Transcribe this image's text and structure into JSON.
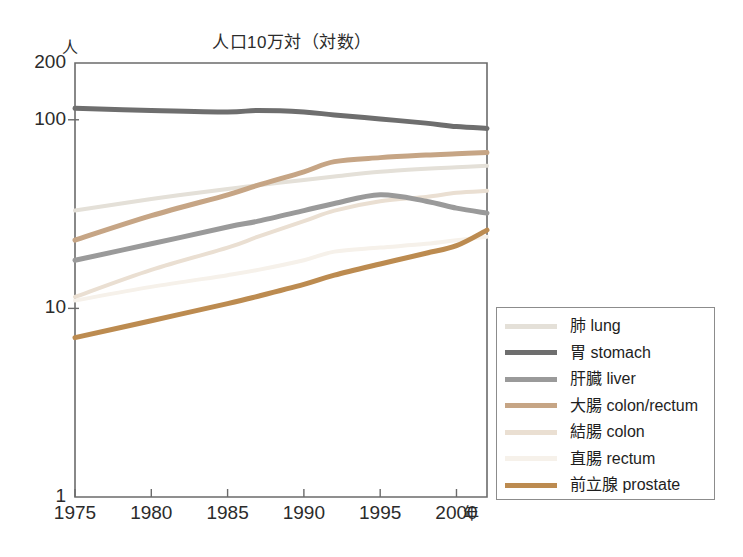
{
  "chart_data": {
    "type": "line",
    "title": "人口10万対（対数）",
    "ylabel": "人",
    "xlabel": "年",
    "log_y": true,
    "grid": false,
    "legend_position": "right-bottom",
    "xlim": [
      1975,
      2002
    ],
    "ylim": [
      1,
      200
    ],
    "ytick_labels": [
      "200",
      "100",
      "10",
      "1"
    ],
    "ytick_values": [
      200,
      100,
      10,
      1
    ],
    "xtick_labels": [
      "1975",
      "1980",
      "1985",
      "1990",
      "1995",
      "2000"
    ],
    "xtick_values": [
      1975,
      1980,
      1985,
      1990,
      1995,
      2000
    ],
    "x": [
      1975,
      1980,
      1985,
      1987,
      1990,
      1992,
      1995,
      1998,
      2000,
      2002
    ],
    "series": [
      {
        "name": "肺 lung",
        "name_ja": "肺",
        "name_en": "lung",
        "color": "#e4e0d8",
        "width": 4,
        "values": [
          33,
          38,
          43,
          45,
          48,
          50,
          53,
          55,
          56,
          57
        ]
      },
      {
        "name": "胃 stomach",
        "name_ja": "胃",
        "name_en": "stomach",
        "color": "#6e6e6e",
        "width": 5,
        "values": [
          115,
          112,
          110,
          112,
          110,
          106,
          101,
          96,
          92,
          90
        ]
      },
      {
        "name": "肝臓 liver",
        "name_ja": "肝臓",
        "name_en": "liver",
        "color": "#9a9a9a",
        "width": 5,
        "values": [
          18,
          22,
          27,
          29,
          33,
          36,
          40,
          37,
          34,
          32
        ]
      },
      {
        "name": "大腸 colon/rectum",
        "name_ja": "大腸",
        "name_en": "colon/rectum",
        "color": "#c6a585",
        "width": 5,
        "values": [
          23,
          31,
          40,
          45,
          53,
          60,
          63,
          65,
          66,
          67
        ]
      },
      {
        "name": "結腸 colon",
        "name_ja": "結腸",
        "name_en": "colon",
        "color": "#eadfd2",
        "width": 4,
        "values": [
          11.5,
          16,
          21,
          24,
          29,
          33,
          37,
          39,
          41,
          42
        ]
      },
      {
        "name": "直腸 rectum",
        "name_ja": "直腸",
        "name_en": "rectum",
        "color": "#f6f1ea",
        "width": 4,
        "values": [
          11,
          13,
          15,
          16,
          18,
          20,
          21,
          22,
          23,
          24
        ]
      },
      {
        "name": "前立腺 prostate",
        "name_ja": "前立腺",
        "name_en": "prostate",
        "color": "#bc8b50",
        "width": 5,
        "values": [
          7,
          8.6,
          10.6,
          11.6,
          13.4,
          15,
          17.2,
          19.6,
          21.5,
          26
        ]
      }
    ]
  },
  "legend": {
    "items": [
      {
        "label": "肺 lung",
        "color": "#e4e0d8"
      },
      {
        "label": "胃 stomach",
        "color": "#6e6e6e"
      },
      {
        "label": "肝臓 liver",
        "color": "#9a9a9a"
      },
      {
        "label": "大腸 colon/rectum",
        "color": "#c6a585"
      },
      {
        "label": "結腸 colon",
        "color": "#eadfd2"
      },
      {
        "label": "直腸 rectum",
        "color": "#f6f1ea"
      },
      {
        "label": "前立腺 prostate",
        "color": "#bc8b50"
      }
    ]
  },
  "axis": {
    "frame_color": "#6b6b6b",
    "text_color": "#2b2b2b"
  }
}
